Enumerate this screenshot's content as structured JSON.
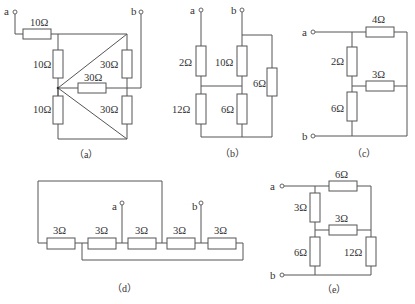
{
  "figure": {
    "subfigures": [
      {
        "id": "a",
        "caption": "（a）",
        "terminals": {
          "a": "a",
          "b": "b"
        },
        "resistors": {
          "r_top": "10Ω",
          "r_left_upper": "10Ω",
          "r_left_lower": "10Ω",
          "r_right_upper": "30Ω",
          "r_middle": "30Ω",
          "r_right_lower": "30Ω"
        }
      },
      {
        "id": "b",
        "caption": "（b）",
        "terminals": {
          "a": "a",
          "b": "b"
        },
        "resistors": {
          "r_a_upper": "2Ω",
          "r_a_lower": "12Ω",
          "r_b_upper": "10Ω",
          "r_b_lower": "6Ω",
          "r_right": "6Ω"
        }
      },
      {
        "id": "c",
        "caption": "（c）",
        "terminals": {
          "a": "a",
          "b": "b"
        },
        "resistors": {
          "r_top": "4Ω",
          "r_left_upper": "2Ω",
          "r_middle": "3Ω",
          "r_left_lower": "6Ω"
        }
      },
      {
        "id": "d",
        "caption": "（d）",
        "terminals": {
          "a": "a",
          "b": "b"
        },
        "resistors": {
          "r1": "3Ω",
          "r2": "3Ω",
          "r3": "3Ω",
          "r4": "3Ω",
          "r5": "3Ω"
        }
      },
      {
        "id": "e",
        "caption": "（e）",
        "terminals": {
          "a": "a",
          "b": "b"
        },
        "resistors": {
          "r_top": "6Ω",
          "r_left_upper": "3Ω",
          "r_middle": "3Ω",
          "r_left_lower": "6Ω",
          "r_right": "12Ω"
        }
      }
    ]
  }
}
